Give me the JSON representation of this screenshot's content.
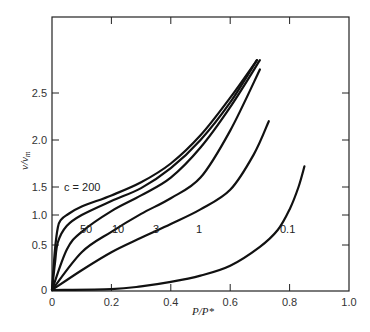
{
  "chart_data": {
    "type": "line",
    "title": "",
    "xlabel": "P/P*",
    "ylabel": "v/v_m",
    "xlim": [
      0,
      1.0
    ],
    "ylim": [
      0,
      2.8
    ],
    "grid": false,
    "legend": "none (curves labeled inline)",
    "x_ticks": [
      0,
      0.2,
      0.4,
      0.6,
      0.8,
      1.0
    ],
    "x_tick_labels": [
      "0",
      "0.2",
      "0.4",
      "0.6",
      "0.8",
      "1.0"
    ],
    "y_ticks": [
      0,
      0.5,
      1.0,
      1.5,
      2.0,
      2.5
    ],
    "y_tick_labels": [
      "0",
      "0.5",
      "1.0",
      "1.5",
      "2.0",
      "2.5"
    ],
    "series": [
      {
        "name": "c = 200",
        "label": "c = 200",
        "x": [
          0,
          0.01,
          0.02,
          0.03,
          0.05,
          0.1,
          0.2,
          0.3,
          0.4,
          0.5,
          0.6,
          0.69
        ],
        "y": [
          0,
          0.45,
          0.8,
          0.92,
          1.0,
          1.15,
          1.35,
          1.55,
          1.75,
          2.05,
          2.45,
          2.85
        ]
      },
      {
        "name": "50",
        "label": "50",
        "x": [
          0,
          0.01,
          0.02,
          0.05,
          0.1,
          0.2,
          0.3,
          0.4,
          0.5,
          0.6,
          0.69
        ],
        "y": [
          0,
          0.3,
          0.55,
          0.82,
          1.0,
          1.25,
          1.48,
          1.7,
          2.0,
          2.4,
          2.85
        ]
      },
      {
        "name": "10",
        "label": "10",
        "x": [
          0,
          0.05,
          0.1,
          0.2,
          0.3,
          0.4,
          0.5,
          0.6,
          0.7
        ],
        "y": [
          0,
          0.45,
          0.72,
          1.07,
          1.35,
          1.6,
          1.92,
          2.35,
          2.85
        ]
      },
      {
        "name": "3",
        "label": "3",
        "x": [
          0,
          0.1,
          0.2,
          0.3,
          0.4,
          0.5,
          0.6,
          0.7
        ],
        "y": [
          0,
          0.42,
          0.72,
          1.02,
          1.3,
          1.6,
          2.1,
          2.75
        ]
      },
      {
        "name": "1",
        "label": "1",
        "x": [
          0,
          0.1,
          0.2,
          0.3,
          0.4,
          0.5,
          0.6,
          0.68,
          0.73
        ],
        "y": [
          0,
          0.22,
          0.42,
          0.62,
          0.85,
          1.1,
          1.45,
          1.85,
          2.2
        ]
      },
      {
        "name": "0.1",
        "label": "0.1",
        "x": [
          0,
          0.2,
          0.3,
          0.4,
          0.5,
          0.6,
          0.7,
          0.76,
          0.8,
          0.83,
          0.85
        ],
        "y": [
          0,
          0.01,
          0.04,
          0.09,
          0.16,
          0.27,
          0.48,
          0.75,
          1.1,
          1.5,
          1.72
        ]
      }
    ],
    "annotations": [
      "c = 200",
      "50",
      "10",
      "3",
      "1",
      "0.1"
    ]
  },
  "labels": {
    "xlabel": "P/P*",
    "ylabel_main": "v/v",
    "ylabel_sub": "m",
    "curve_c200": "c = 200",
    "curve_50": "50",
    "curve_10": "10",
    "curve_3": "3",
    "curve_1": "1",
    "curve_01": "0.1"
  }
}
